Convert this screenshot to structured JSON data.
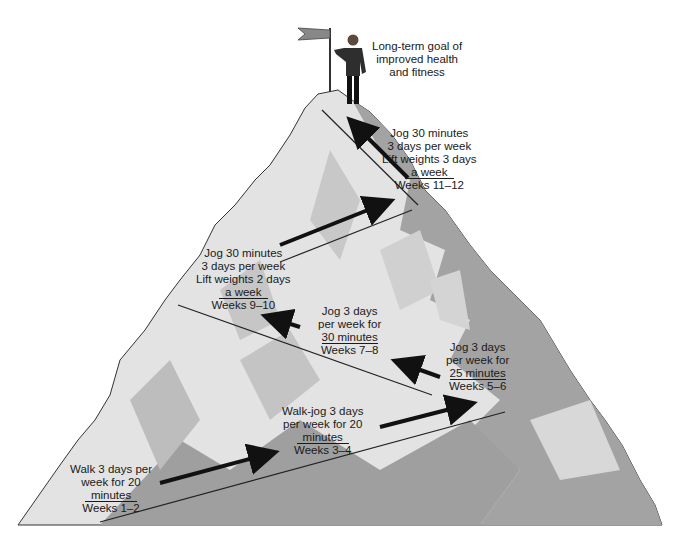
{
  "diagram": {
    "type": "progression-mountain",
    "goal": {
      "lines": [
        "Long-term goal of",
        "improved health",
        "and fitness"
      ]
    },
    "stages": [
      {
        "id": "weeks-1-2",
        "lines": [
          "Walk 3 days per",
          "week for 20"
        ],
        "underlined": "minutes",
        "weeks": "Weeks 1–2"
      },
      {
        "id": "weeks-3-4",
        "lines": [
          "Walk-jog 3 days",
          "per week for 20"
        ],
        "underlined": "minutes",
        "weeks": "Weeks 3–4"
      },
      {
        "id": "weeks-5-6",
        "lines": [
          "Jog 3 days",
          "per week for"
        ],
        "underlined": "25 minutes",
        "weeks": "Weeks 5–6"
      },
      {
        "id": "weeks-7-8",
        "lines": [
          "Jog 3 days",
          "per week for"
        ],
        "underlined": "30 minutes",
        "weeks": "Weeks 7–8"
      },
      {
        "id": "weeks-9-10",
        "lines": [
          "Jog 30 minutes",
          "3 days per week",
          "Lift weights 2 days"
        ],
        "underlined": "a week",
        "weeks": "Weeks 9–10"
      },
      {
        "id": "weeks-11-12",
        "lines": [
          "Jog 30 minutes",
          "3 days per week",
          "Lift weights 3 days"
        ],
        "underlined": "a week",
        "weeks": "Weeks 11–12"
      }
    ],
    "colors": {
      "mountain_light": "#e6e6e6",
      "mountain_mid": "#bdbdbd",
      "mountain_dark": "#9a9a9a",
      "outline": "#333333",
      "arrow": "#111111",
      "text": "#1a1a1a"
    }
  }
}
